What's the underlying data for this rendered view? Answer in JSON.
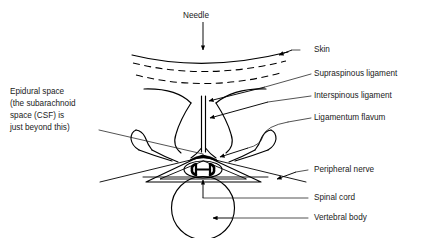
{
  "figure": {
    "title_text": "Needle",
    "background_color": "#ffffff",
    "line_color": "#000000",
    "text_color": "#1a1a1a"
  },
  "labels": {
    "needle": "Needle",
    "skin": "Skin",
    "supraspinous_ligament": "Supraspinous ligament",
    "interspinous_ligament": "Interspinous ligament",
    "ligamentum_flavum": "Ligamentum flavum",
    "peripheral_nerve": "Peripheral nerve",
    "spinal_cord": "Spinal cord",
    "vertebral_body": "Vertebral body",
    "epidural_space_line1": "Epidural space",
    "epidural_space_line2": "(the subarachnoid",
    "epidural_space_line3": "space (CSF) is",
    "epidural_space_line4": "just beyond this)"
  },
  "structures": {
    "skin_layers": "skin-surface-curves",
    "spinous_process": "spinous-process-stem",
    "transverse_processes": "transverse-process-wings",
    "lamina": "vertebral-lamina",
    "spinal_canal": "spinal-canal-triangle",
    "cord": "spinal-cord-ellipse",
    "grey_matter": "butterfly-grey-matter",
    "vertebral_body_shape": "vertebral-body-circle",
    "nerve_roots": "peripheral-nerve-lines"
  }
}
